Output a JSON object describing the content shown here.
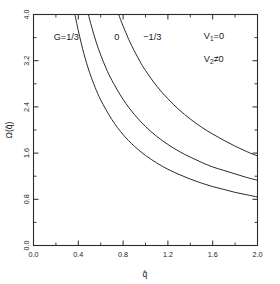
{
  "chart_data": {
    "type": "line",
    "title": "",
    "xlabel": "q̂",
    "ylabel": "Ω(q̂)",
    "xlim": [
      0.0,
      2.0
    ],
    "ylim": [
      0.0,
      4.0
    ],
    "grid": false,
    "legend_position": "inline-curve-labels",
    "xticks": [
      "0.0",
      "0.4",
      "0.8",
      "1.2",
      "1.6",
      "2.0"
    ],
    "xtick_values": [
      0.0,
      0.4,
      0.8,
      1.2,
      1.6,
      2.0
    ],
    "yticks": [
      "0.0",
      "0.8",
      "1.6",
      "2.4",
      "3.2",
      "4.0"
    ],
    "ytick_values": [
      0.0,
      0.8,
      1.6,
      2.4,
      3.2,
      4.0
    ],
    "minor_ticks_per_interval": 1,
    "annotations": [
      {
        "name": "curve-label-g-one-third",
        "text": "G=1/3",
        "x": 0.18,
        "y": 3.55
      },
      {
        "name": "curve-label-zero",
        "text": "0",
        "x": 0.72,
        "y": 3.55
      },
      {
        "name": "curve-label-minus-one-third",
        "text": "−1/3",
        "x": 0.98,
        "y": 3.55
      },
      {
        "name": "condition-v1",
        "text": "V",
        "sub": "1",
        "tail": "=0",
        "x": 1.52,
        "y": 3.58
      },
      {
        "name": "condition-v2",
        "text": "V",
        "sub": "2",
        "tail": "≠0",
        "x": 1.52,
        "y": 3.18
      }
    ],
    "series": [
      {
        "name": "G=1/3",
        "x": [
          0.37,
          0.4,
          0.45,
          0.5,
          0.55,
          0.6,
          0.7,
          0.8,
          0.9,
          1.0,
          1.1,
          1.2,
          1.3,
          1.4,
          1.5,
          1.6,
          1.7,
          1.8,
          1.9,
          2.0
        ],
        "values": [
          4.0,
          3.72,
          3.32,
          3.0,
          2.74,
          2.52,
          2.18,
          1.92,
          1.72,
          1.56,
          1.43,
          1.32,
          1.23,
          1.15,
          1.08,
          1.02,
          0.97,
          0.92,
          0.88,
          0.84
        ]
      },
      {
        "name": "0",
        "x": [
          0.49,
          0.52,
          0.56,
          0.6,
          0.65,
          0.7,
          0.8,
          0.9,
          1.0,
          1.1,
          1.2,
          1.3,
          1.4,
          1.5,
          1.6,
          1.7,
          1.8,
          1.9,
          2.0
        ],
        "values": [
          4.0,
          3.78,
          3.52,
          3.3,
          3.06,
          2.86,
          2.53,
          2.27,
          2.06,
          1.89,
          1.75,
          1.63,
          1.53,
          1.44,
          1.36,
          1.3,
          1.24,
          1.18,
          1.13
        ]
      },
      {
        "name": "−1/3",
        "x": [
          0.76,
          0.8,
          0.85,
          0.9,
          0.95,
          1.0,
          1.1,
          1.2,
          1.3,
          1.4,
          1.5,
          1.6,
          1.7,
          1.8,
          1.9,
          2.0
        ],
        "values": [
          4.0,
          3.8,
          3.57,
          3.37,
          3.19,
          3.03,
          2.76,
          2.54,
          2.35,
          2.19,
          2.05,
          1.93,
          1.82,
          1.72,
          1.63,
          1.55
        ]
      }
    ]
  }
}
